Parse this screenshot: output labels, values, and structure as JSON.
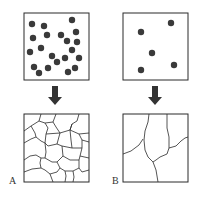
{
  "panels": [
    {
      "id": "A",
      "label": "A",
      "before": {
        "dot_count": 21,
        "description": "many nuclei"
      },
      "after": {
        "description": "many small grains"
      }
    },
    {
      "id": "B",
      "label": "B",
      "before": {
        "dot_count": 5,
        "description": "few nuclei"
      },
      "after": {
        "description": "few large grains"
      }
    }
  ],
  "colors": {
    "stroke": "#2a2a2a",
    "dot": "#3a3a3a",
    "arrow": "#333333",
    "background": "#ffffff"
  }
}
